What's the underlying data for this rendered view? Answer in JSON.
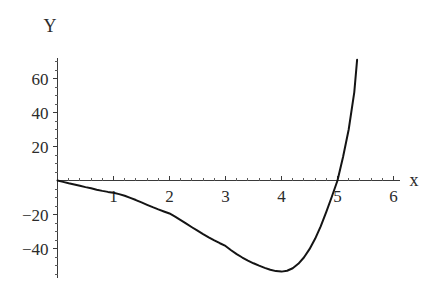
{
  "chart_data": {
    "type": "line",
    "title": "",
    "subtitle": "",
    "xlabel": "x",
    "ylabel": "Y",
    "xlim": [
      -0.15,
      6.2
    ],
    "ylim": [
      -60,
      72
    ],
    "grid": false,
    "legend": null,
    "annotations": [],
    "x_ticks": [
      {
        "value": 1,
        "label": "1"
      },
      {
        "value": 2,
        "label": "2"
      },
      {
        "value": 3,
        "label": "3"
      },
      {
        "value": 4,
        "label": "4"
      },
      {
        "value": 5,
        "label": "5"
      },
      {
        "value": 6,
        "label": "6"
      }
    ],
    "y_ticks": [
      {
        "value": 60,
        "label": "60"
      },
      {
        "value": 40,
        "label": "40"
      },
      {
        "value": 20,
        "label": "20"
      },
      {
        "value": -20,
        "label": "-20"
      },
      {
        "value": -40,
        "label": "-40"
      }
    ],
    "x_tick_minor_step": 0.2,
    "y_tick_minor_step": 5,
    "series": [
      {
        "name": "curve",
        "color": "#141414",
        "x": [
          0.0,
          0.1,
          0.2,
          0.3,
          0.4,
          0.5,
          0.6,
          0.7,
          0.8,
          0.9,
          1.0,
          1.1,
          1.2,
          1.3,
          1.4,
          1.5,
          1.6,
          1.7,
          1.8,
          1.9,
          2.0,
          2.1,
          2.2,
          2.3,
          2.4,
          2.5,
          2.6,
          2.7,
          2.8,
          2.9,
          3.0,
          3.1,
          3.2,
          3.3,
          3.4,
          3.5,
          3.6,
          3.7,
          3.8,
          3.9,
          4.0,
          4.1,
          4.2,
          4.3,
          4.4,
          4.5,
          4.6,
          4.7,
          4.8,
          4.9,
          5.0,
          5.1,
          5.2,
          5.3,
          5.35
        ],
        "y": [
          0.0,
          -0.8,
          -1.6,
          -2.3,
          -3.1,
          -3.9,
          -4.6,
          -5.4,
          -6.1,
          -6.7,
          -7.2,
          -8.0,
          -9.0,
          -10.2,
          -11.5,
          -12.9,
          -14.3,
          -15.7,
          -17.0,
          -18.2,
          -19.4,
          -21.3,
          -23.3,
          -25.4,
          -27.5,
          -29.5,
          -31.5,
          -33.4,
          -35.2,
          -36.9,
          -38.5,
          -41.0,
          -43.3,
          -45.3,
          -47.1,
          -48.7,
          -50.1,
          -51.4,
          -52.5,
          -53.3,
          -53.6,
          -53.1,
          -51.6,
          -49.0,
          -45.3,
          -40.4,
          -34.3,
          -27.0,
          -18.4,
          -9.4,
          0.0,
          14.0,
          30.0,
          52.0,
          71.0
        ]
      }
    ]
  },
  "axes": {
    "y_axis_name": "Y",
    "x_axis_name": "x"
  },
  "colors": {
    "curve": "#141414",
    "axis": "#3a3a3a",
    "text": "#2b2b2b",
    "background": "#ffffff"
  }
}
